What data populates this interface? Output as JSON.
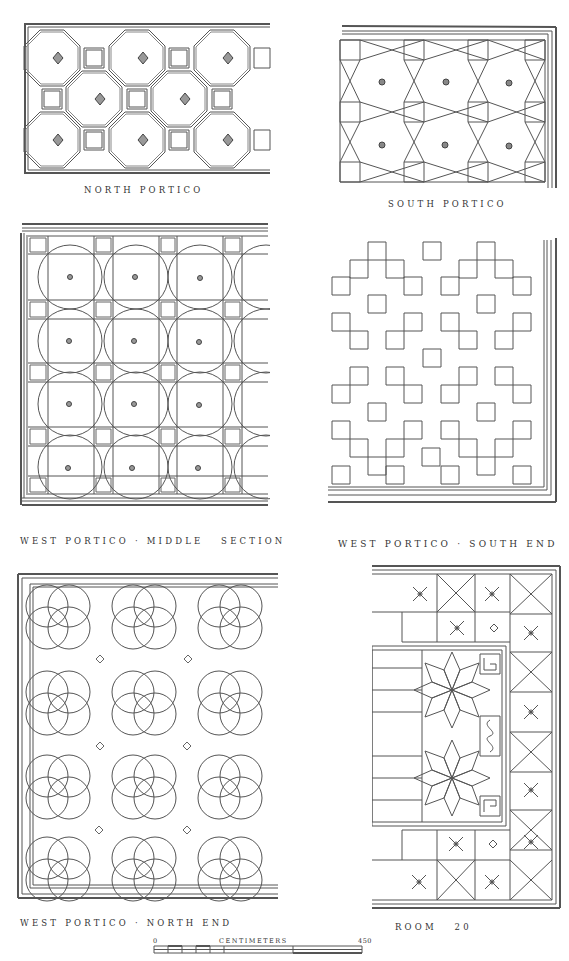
{
  "figure": {
    "panels": [
      {
        "id": "north-portico",
        "label": "NORTH PORTICO",
        "pattern": "octagons-and-squares"
      },
      {
        "id": "south-portico",
        "label": "SOUTH PORTICO",
        "pattern": "interlaced-octagons-and-squares"
      },
      {
        "id": "west-portico-middle",
        "label": "WEST PORTICO · MIDDLE   SECTION",
        "pattern": "circles-in-square-grid"
      },
      {
        "id": "west-portico-south",
        "label": "WEST PORTICO · SOUTH END",
        "pattern": "stepped-squares"
      },
      {
        "id": "west-portico-north",
        "label": "WEST PORTICO · NORTH END",
        "pattern": "quatrefoil-circles"
      },
      {
        "id": "room-20",
        "label": "ROOM   20",
        "pattern": "star-and-saltire-border"
      }
    ],
    "scale_bar": {
      "start": "0",
      "unit": "CENTIMETERS",
      "end": "450"
    },
    "line_color": "#555555",
    "background": "#ffffff"
  }
}
